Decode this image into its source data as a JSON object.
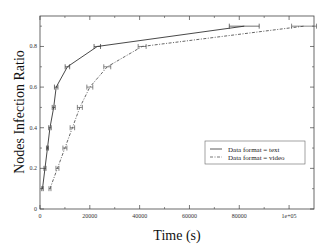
{
  "chart_data": {
    "type": "line",
    "title": "",
    "xlabel": "Time (s)",
    "ylabel": "Nodes Infection Ratio",
    "xlim": [
      0,
      110000
    ],
    "ylim": [
      0,
      0.95
    ],
    "x_ticks": [
      0,
      20000,
      40000,
      60000,
      80000,
      100000
    ],
    "x_tick_labels": [
      "0",
      "20000",
      "40000",
      "60000",
      "80000",
      "1e+05"
    ],
    "y_ticks": [
      0,
      0.2,
      0.4,
      0.6,
      0.8
    ],
    "y_tick_labels": [
      "0",
      "0.2",
      "0.4",
      "0.6",
      "0.8"
    ],
    "grid": false,
    "legend_position": "lower right",
    "series": [
      {
        "name": "Data format = text",
        "style": "solid",
        "color": "#333333",
        "x": [
          1000,
          2000,
          3000,
          4000,
          5500,
          6500,
          11000,
          23000,
          82000
        ],
        "y": [
          0.1,
          0.2,
          0.3,
          0.4,
          0.5,
          0.6,
          0.7,
          0.8,
          0.9
        ],
        "x_err": [
          300,
          400,
          400,
          500,
          600,
          700,
          900,
          1300,
          6000
        ]
      },
      {
        "name": "Data format = video",
        "style": "dashdot",
        "color": "#555555",
        "x": [
          4000,
          7000,
          10000,
          13000,
          16000,
          20000,
          27000,
          41000,
          106000
        ],
        "y": [
          0.1,
          0.2,
          0.3,
          0.4,
          0.5,
          0.6,
          0.7,
          0.8,
          0.9
        ],
        "x_err": [
          400,
          600,
          800,
          900,
          1000,
          1200,
          1400,
          1600,
          5000
        ]
      }
    ]
  }
}
